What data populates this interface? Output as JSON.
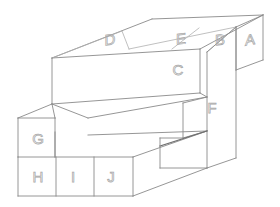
{
  "figure": {
    "type": "isometric-block-diagram",
    "background_color": "#ffffff",
    "line_color": "#8a8a8a",
    "label_color": "#a8a8a8",
    "label_style": "outline"
  },
  "labels": {
    "a": "A",
    "b": "B",
    "c": "C",
    "d": "D",
    "e": "E",
    "f": "F",
    "g": "G",
    "h": "H",
    "i": "I",
    "j": "J"
  },
  "faces": [
    {
      "id": "A",
      "label": "A",
      "plane": "right",
      "x": 250,
      "y": 40
    },
    {
      "id": "B",
      "label": "B",
      "plane": "top",
      "x": 219,
      "y": 40
    },
    {
      "id": "C",
      "label": "C",
      "plane": "right",
      "x": 178,
      "y": 70
    },
    {
      "id": "D",
      "label": "D",
      "plane": "top",
      "x": 110,
      "y": 40
    },
    {
      "id": "E",
      "label": "E",
      "plane": "top",
      "x": 180,
      "y": 39
    },
    {
      "id": "F",
      "label": "F",
      "plane": "right",
      "x": 212,
      "y": 108
    },
    {
      "id": "G",
      "label": "G",
      "plane": "front",
      "x": 38,
      "y": 139
    },
    {
      "id": "H",
      "label": "H",
      "plane": "front",
      "x": 38,
      "y": 177
    },
    {
      "id": "I",
      "label": "I",
      "plane": "front",
      "x": 72,
      "y": 177
    },
    {
      "id": "J",
      "label": "J",
      "plane": "front",
      "x": 110,
      "y": 177
    }
  ]
}
